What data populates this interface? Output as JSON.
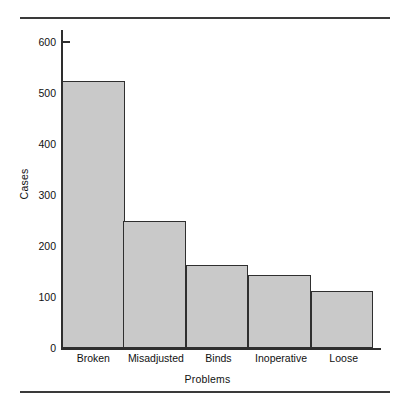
{
  "chart_data": {
    "type": "bar",
    "title": "",
    "subtitle": "",
    "xlabel": "Problems",
    "ylabel": "Cases",
    "categories": [
      "Broken",
      "Misadjusted",
      "Binds",
      "Inoperative",
      "Loose"
    ],
    "values": [
      524,
      249,
      163,
      143,
      112
    ],
    "ylim": [
      0,
      600
    ],
    "ytick_labels": [
      "0",
      "100",
      "200",
      "300",
      "400",
      "500",
      "600"
    ],
    "ytick_values": [
      0,
      100,
      200,
      300,
      400,
      500,
      600
    ],
    "grid": false,
    "legend": null,
    "bar_fill_color": "#c9c9c9",
    "bar_edge_color": "#2f2f2f",
    "axis_color": "#2e2e2e",
    "rule_color": "#3a3a3a"
  }
}
